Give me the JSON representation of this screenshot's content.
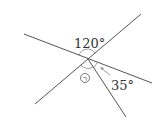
{
  "diagram": {
    "type": "intersecting-lines-angles",
    "colors": {
      "line": "#555555",
      "arc": "#888888",
      "text": "#333333"
    },
    "lines": [
      {
        "id": "line-a",
        "x1": 24,
        "y1": 34,
        "x2": 152,
        "y2": 83
      },
      {
        "id": "line-b",
        "x1": 35,
        "y1": 104,
        "x2": 141,
        "y2": 14
      },
      {
        "id": "line-c",
        "x1": 88,
        "y1": 59,
        "x2": 126,
        "y2": 117
      }
    ],
    "intersection": {
      "x": 88,
      "y": 59
    },
    "labels": {
      "angle_top": "120°",
      "angle_right": "35°",
      "unknown_angle": "㉠"
    }
  }
}
